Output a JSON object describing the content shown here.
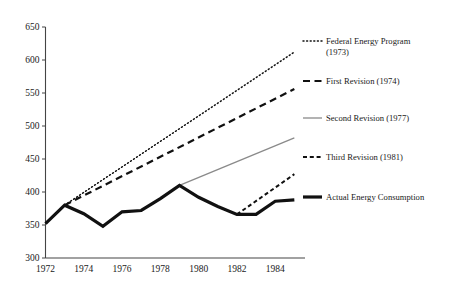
{
  "chart_data": {
    "type": "line",
    "title": "",
    "subtitle": "",
    "xlabel": "",
    "ylabel": "",
    "xlim": [
      1972,
      1985.4
    ],
    "ylim": [
      300,
      650
    ],
    "yticks": [
      300,
      350,
      400,
      450,
      500,
      550,
      600,
      650
    ],
    "xticks": [
      1972,
      1974,
      1976,
      1978,
      1980,
      1982,
      1984
    ],
    "xtick_labels": [
      "1972",
      "1974",
      "1976",
      "1978",
      "1980",
      "1982",
      "1984"
    ],
    "ytick_labels": [
      "300",
      "350",
      "400",
      "450",
      "500",
      "550",
      "600",
      "650"
    ],
    "grid": false,
    "legend_position": "right",
    "series": [
      {
        "name": "Federal Energy Program (1973)",
        "style": "dotted",
        "color": "#111111",
        "width": 1.5,
        "x": [
          1973,
          1985
        ],
        "values": [
          380,
          612
        ]
      },
      {
        "name": "First Revision (1974)",
        "style": "long-dash",
        "color": "#111111",
        "width": 2.2,
        "x": [
          1973,
          1985
        ],
        "values": [
          380,
          556
        ]
      },
      {
        "name": "Second Revision (1977)",
        "style": "solid-thin",
        "color": "#8a8a8a",
        "width": 1.3,
        "x": [
          1979,
          1985
        ],
        "values": [
          410,
          482
        ]
      },
      {
        "name": "Third Revision (1981)",
        "style": "short-dash",
        "color": "#111111",
        "width": 2.0,
        "x": [
          1982,
          1985
        ],
        "values": [
          366,
          427
        ]
      },
      {
        "name": "Actual Energy Consumption",
        "style": "solid-thick",
        "color": "#111111",
        "width": 3.2,
        "x": [
          1972,
          1973,
          1974,
          1975,
          1976,
          1977,
          1978,
          1979,
          1980,
          1981,
          1982,
          1983,
          1984,
          1985
        ],
        "values": [
          352,
          380,
          367,
          348,
          370,
          372,
          390,
          410,
          392,
          378,
          366,
          366,
          386,
          388
        ]
      }
    ]
  },
  "legend": {
    "entries": [
      {
        "label_line1": "Federal Energy Program",
        "label_line2": "(1973)",
        "swatch": "dotted-swatch"
      },
      {
        "label_line1": "First Revision (1974)",
        "label_line2": "",
        "swatch": "long-dash-swatch"
      },
      {
        "label_line1": "Second Revision (1977)",
        "label_line2": "",
        "swatch": "gray-solid-swatch"
      },
      {
        "label_line1": "Third Revision (1981)",
        "label_line2": "",
        "swatch": "short-dash-swatch"
      },
      {
        "label_line1": "Actual Energy Consumption",
        "label_line2": "",
        "swatch": "thick-solid-swatch"
      }
    ]
  }
}
